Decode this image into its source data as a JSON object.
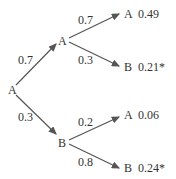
{
  "root": {
    "label": "A"
  },
  "level1": [
    {
      "label": "A",
      "prob": "0.7"
    },
    {
      "label": "B",
      "prob": "0.3"
    }
  ],
  "level2": [
    {
      "label": "A",
      "prob": "0.7",
      "result": "0.49"
    },
    {
      "label": "B",
      "prob": "0.3",
      "result": "0.21*"
    },
    {
      "label": "A",
      "prob": "0.2",
      "result": "0.06"
    },
    {
      "label": "B",
      "prob": "0.8",
      "result": "0.24*"
    }
  ],
  "colors": {
    "line": "#555555",
    "text": "#333333"
  }
}
